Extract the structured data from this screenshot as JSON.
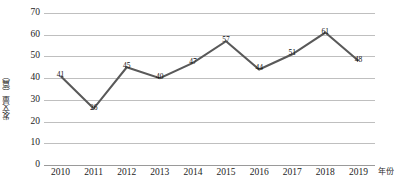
{
  "chart_data": {
    "type": "line",
    "title": "",
    "subtitle": "",
    "xlabel": "年份",
    "ylabel": "发文量（篇）",
    "categories": [
      "2010",
      "2011",
      "2012",
      "2013",
      "2014",
      "2015",
      "2016",
      "2017",
      "2018",
      "2019"
    ],
    "values": [
      41,
      26,
      45,
      40,
      47,
      57,
      44,
      51,
      61,
      48
    ],
    "point_labels": [
      "41",
      "26",
      "45",
      "40",
      "47",
      "57",
      "44",
      "51",
      "61",
      "48"
    ],
    "ylim": [
      0,
      70
    ],
    "yticks": [
      0,
      10,
      20,
      30,
      40,
      50,
      60,
      70
    ],
    "ytick_labels": [
      "0",
      "10",
      "20",
      "30",
      "40",
      "50",
      "60",
      "70"
    ],
    "grid": true,
    "legend": false,
    "legend_position": "none",
    "series": [
      {
        "name": "发文量",
        "values": [
          41,
          26,
          45,
          40,
          47,
          57,
          44,
          51,
          61,
          48
        ],
        "line_color": "#595959",
        "marker": "none",
        "show_labels": true
      }
    ]
  },
  "style": {
    "line_color": "#595959",
    "grid_color": "#bfbfbf",
    "axis_color": "#9a9a9a",
    "text_color": "#1c1c1c",
    "background": "#ffffff"
  }
}
